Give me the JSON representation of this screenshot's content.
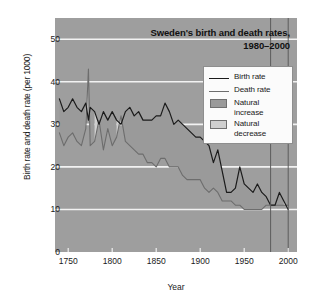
{
  "chart_data": {
    "type": "area",
    "title": "Sweden's birth and death rates,",
    "title_line2": "1980–2000",
    "xlabel": "Year",
    "ylabel": "Birth rate and death rate (per 1000)",
    "xlim": [
      1735,
      2010
    ],
    "ylim": [
      0,
      55
    ],
    "xticks": [
      1750,
      1800,
      1850,
      1900,
      1950,
      2000
    ],
    "yticks": [
      0,
      10,
      20,
      30,
      40,
      50
    ],
    "grid": "horizontal-white",
    "legend_position": "top-right-inside",
    "markers": {
      "label": "highlighted period",
      "years": [
        1980,
        2000
      ]
    },
    "colors": {
      "panel_background": "#9e9e9e",
      "gridline": "#f2f2f2",
      "birth_rate_line": "#1b1b1b",
      "death_rate_line": "#6d6d6d",
      "natural_increase_fill": "#9a9a9a",
      "natural_decrease_fill": "#cfcfcf",
      "legend_background": "#fbfbfb",
      "page_background": "#ffffff"
    },
    "legend": [
      {
        "label": "Birth rate",
        "type": "line",
        "color": "#1b1b1b"
      },
      {
        "label": "Death rate",
        "type": "line",
        "color": "#6d6d6d"
      },
      {
        "label": "Natural increase",
        "type": "swatch",
        "color": "#9a9a9a"
      },
      {
        "label": "Natural decrease",
        "type": "swatch",
        "color": "#cfcfcf"
      }
    ],
    "series": [
      {
        "name": "Birth rate",
        "x": [
          1740,
          1745,
          1750,
          1755,
          1760,
          1765,
          1770,
          1773,
          1775,
          1780,
          1785,
          1790,
          1795,
          1800,
          1805,
          1810,
          1815,
          1820,
          1825,
          1830,
          1835,
          1840,
          1845,
          1850,
          1855,
          1860,
          1865,
          1870,
          1875,
          1880,
          1885,
          1890,
          1895,
          1900,
          1905,
          1910,
          1915,
          1920,
          1925,
          1930,
          1935,
          1940,
          1945,
          1950,
          1955,
          1960,
          1965,
          1970,
          1975,
          1980,
          1985,
          1990,
          1995,
          2000
        ],
        "values": [
          36,
          33,
          34,
          36,
          34,
          33,
          35,
          31,
          34,
          33,
          30,
          33,
          31,
          33,
          31,
          30,
          33,
          34,
          32,
          33,
          31,
          31,
          31,
          32,
          32,
          35,
          33,
          30,
          31,
          30,
          29,
          28,
          27,
          27,
          26,
          25,
          21,
          24,
          19,
          14,
          14,
          15,
          20,
          16,
          15,
          14,
          16,
          14,
          13,
          11,
          11,
          14,
          12,
          10
        ]
      },
      {
        "name": "Death rate",
        "x": [
          1740,
          1745,
          1750,
          1755,
          1760,
          1765,
          1770,
          1773,
          1775,
          1780,
          1785,
          1790,
          1795,
          1800,
          1805,
          1810,
          1815,
          1820,
          1825,
          1830,
          1835,
          1840,
          1845,
          1850,
          1855,
          1860,
          1865,
          1870,
          1875,
          1880,
          1885,
          1890,
          1895,
          1900,
          1905,
          1910,
          1915,
          1920,
          1925,
          1930,
          1935,
          1940,
          1945,
          1950,
          1955,
          1960,
          1965,
          1970,
          1975,
          1980,
          1985,
          1990,
          1995,
          2000
        ],
        "values": [
          28,
          25,
          27,
          28,
          26,
          25,
          29,
          43,
          25,
          26,
          31,
          24,
          29,
          25,
          27,
          32,
          26,
          25,
          24,
          23,
          23,
          21,
          21,
          20,
          22,
          22,
          20,
          20,
          20,
          18,
          17,
          17,
          17,
          17,
          15,
          14,
          15,
          14,
          12,
          12,
          12,
          11,
          11,
          10,
          10,
          10,
          10,
          10,
          11,
          11,
          11,
          11,
          11,
          11
        ]
      }
    ]
  },
  "axis": {
    "ytick_labels": [
      "0",
      "10",
      "20",
      "30",
      "40",
      "50"
    ],
    "xtick_labels": [
      "1750",
      "1800",
      "1850",
      "1900",
      "1950",
      "2000"
    ]
  }
}
